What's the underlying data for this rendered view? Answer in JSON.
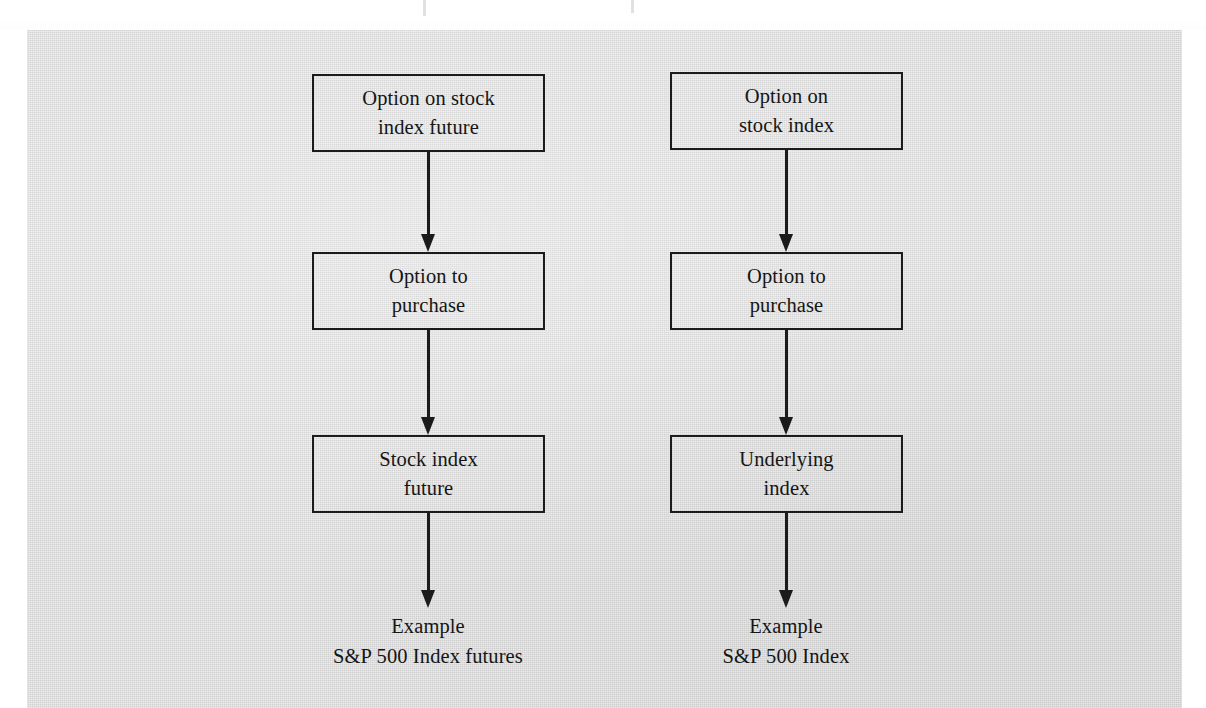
{
  "figure": {
    "panel_color": "#d9d9d9",
    "ink_color": "#1b1b1b",
    "columns": [
      {
        "id": "stock-index-future-column",
        "boxes": [
          {
            "id": "option-on-stock-index-future",
            "line1": "Option on stock",
            "line2": "index future"
          },
          {
            "id": "option-to-purchase-left",
            "line1": "Option to",
            "line2": "purchase"
          },
          {
            "id": "stock-index-future",
            "line1": "Stock index",
            "line2": "future"
          }
        ],
        "example": {
          "line1": "Example",
          "line2": "S&P 500 Index futures"
        }
      },
      {
        "id": "stock-index-column",
        "boxes": [
          {
            "id": "option-on-stock-index",
            "line1": "Option on",
            "line2": "stock index"
          },
          {
            "id": "option-to-purchase-right",
            "line1": "Option to",
            "line2": "purchase"
          },
          {
            "id": "underlying-index",
            "line1": "Underlying",
            "line2": "index"
          }
        ],
        "example": {
          "line1": "Example",
          "line2": "S&P 500 Index"
        }
      }
    ],
    "arrows": [
      {
        "id": "arrow-left-1"
      },
      {
        "id": "arrow-left-2"
      },
      {
        "id": "arrow-left-3"
      },
      {
        "id": "arrow-right-1"
      },
      {
        "id": "arrow-right-2"
      },
      {
        "id": "arrow-right-3"
      }
    ]
  }
}
